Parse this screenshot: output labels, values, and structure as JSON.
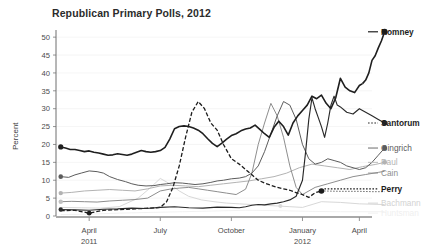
{
  "chart_data": {
    "type": "line",
    "title": "Republican Primary Polls, 2012",
    "xlabel": "",
    "ylabel": "Percent",
    "ylim": [
      0,
      52
    ],
    "xlim": [
      0,
      100
    ],
    "grid": "horizontal-faint",
    "legend_position": "right-inline-endlabels",
    "yticks": [
      0,
      5,
      10,
      15,
      20,
      25,
      30,
      35,
      40,
      45,
      50
    ],
    "ytick_labels": [
      "0",
      "5",
      "10",
      "15",
      "20",
      "25",
      "30",
      "35",
      "40",
      "45",
      "50"
    ],
    "xticks": [
      10.5,
      33.0,
      55.5,
      78.0,
      96.0
    ],
    "xtick_labels": [
      "April",
      "July",
      "October",
      "January",
      "April"
    ],
    "xtick_sublabels": [
      "2011",
      "",
      "",
      "2012",
      ""
    ],
    "x_unit": "percent-of-timeline (Feb 2011 - May 2012)",
    "series": [
      {
        "name": "Romney",
        "label": "Romney",
        "color": "#1f1f1f",
        "width": 1.6,
        "dash": "none",
        "emphasis": "strong",
        "end_value": 51.5,
        "start_value": 19.3,
        "x": [
          1.5,
          3,
          4.5,
          6,
          7.5,
          9,
          10.5,
          12,
          13.5,
          15,
          16.5,
          18,
          19.5,
          21,
          22.5,
          24,
          25.5,
          27,
          28.5,
          30,
          31.5,
          33,
          34.5,
          36,
          37.5,
          39,
          40.5,
          42,
          43.5,
          45,
          46.5,
          48,
          49.5,
          51,
          52.5,
          54,
          55.5,
          57,
          58.5,
          60,
          61.5,
          63,
          64.5,
          66,
          67.5,
          69,
          70.5,
          72,
          73.5,
          75,
          76.5,
          78,
          79.5,
          81,
          82.5,
          84,
          85.5,
          87,
          88.5,
          90,
          91.5,
          93,
          94.5,
          96,
          97
        ],
        "y": [
          19.3,
          19.0,
          18.6,
          18.6,
          18.3,
          18.0,
          18.2,
          17.8,
          17.6,
          17.3,
          17.0,
          17.1,
          17.4,
          17.2,
          17.0,
          17.3,
          17.8,
          18.3,
          18.0,
          17.8,
          18.0,
          18.3,
          19.2,
          21.5,
          24.4,
          25.0,
          25.2,
          25.0,
          24.6,
          24.0,
          23.0,
          21.6,
          20.3,
          19.4,
          20.4,
          21.5,
          22.5,
          23.0,
          23.8,
          24.3,
          24.6,
          25.4,
          24.2,
          23.0,
          22.0,
          24.8,
          26.5,
          25.0,
          22.6,
          26.0,
          28.0,
          29.5,
          31.0,
          33.5,
          32.8,
          33.8,
          31.5,
          30.0,
          33.0,
          38.5,
          36.0,
          35.0,
          34.5,
          36.5,
          37.0
        ]
      },
      {
        "name": "Romney-late",
        "label": "",
        "color": "#1f1f1f",
        "width": 1.6,
        "dash": "none",
        "emphasis": "strong",
        "x": [
          97,
          98,
          99,
          100,
          101,
          102,
          103,
          104
        ],
        "y": [
          37.0,
          38.0,
          40.0,
          43.5,
          44.8,
          47.0,
          49.0,
          51.5
        ]
      },
      {
        "name": "Santorum",
        "label": "Santorum",
        "color": "#2a2a2a",
        "width": 1.15,
        "dash": "none",
        "emphasis": "strong",
        "end_value": 26.0,
        "start_value": 1.8,
        "x": [
          1.5,
          6,
          10.5,
          15,
          19.5,
          24,
          28.5,
          33,
          37.5,
          42,
          46.5,
          51,
          55.5,
          58,
          60,
          62,
          64,
          66,
          68,
          70,
          72,
          74,
          76,
          78,
          79,
          80,
          81,
          82,
          83,
          84,
          85,
          86,
          87,
          88,
          89,
          90,
          92,
          94,
          96,
          98,
          100,
          102,
          104
        ],
        "y": [
          1.8,
          1.7,
          1.6,
          1.9,
          2.0,
          2.2,
          2.1,
          2.4,
          2.6,
          2.3,
          2.2,
          2.5,
          2.4,
          2.3,
          2.6,
          3.0,
          3.2,
          3.1,
          3.4,
          3.6,
          4.0,
          4.5,
          5.5,
          10.0,
          18.0,
          27.0,
          33.0,
          30.0,
          27.5,
          25.0,
          22.0,
          26.0,
          31.0,
          33.5,
          31.0,
          30.5,
          29.0,
          28.5,
          30.0,
          29.0,
          28.0,
          27.0,
          26.0
        ]
      },
      {
        "name": "Gingrich",
        "label": "Gingrich",
        "color": "#5c5c5c",
        "width": 1.0,
        "dash": "none",
        "emphasis": "medium",
        "end_value": 19.0,
        "start_value": 11.0,
        "x": [
          1.5,
          4,
          6,
          8,
          10.5,
          13,
          15,
          17,
          19.5,
          22,
          24,
          26,
          28.5,
          31,
          33,
          35,
          37.5,
          40,
          42,
          44,
          46.5,
          49,
          51,
          53,
          55.5,
          58,
          60,
          62,
          64,
          66,
          68,
          70,
          72,
          74,
          76,
          78,
          80,
          82,
          84,
          86,
          88,
          90,
          92,
          94,
          96,
          98,
          100,
          102,
          104
        ],
        "y": [
          11.0,
          10.8,
          11.5,
          12.0,
          12.6,
          12.4,
          12.0,
          11.0,
          10.2,
          9.6,
          9.0,
          8.6,
          8.4,
          8.5,
          8.8,
          9.0,
          9.3,
          9.2,
          9.0,
          8.8,
          9.0,
          9.4,
          9.8,
          10.0,
          10.4,
          10.6,
          11.0,
          12.0,
          14.0,
          18.0,
          23.0,
          28.0,
          32.0,
          31.0,
          27.0,
          20.0,
          16.0,
          14.5,
          15.0,
          16.0,
          15.5,
          15.0,
          14.0,
          13.5,
          13.0,
          13.5,
          15.0,
          17.0,
          19.0
        ]
      },
      {
        "name": "Paul",
        "label": "Paul",
        "color": "#b3b3b3",
        "width": 1.0,
        "dash": "none",
        "emphasis": "light",
        "end_value": 15.0,
        "start_value": 6.4,
        "x": [
          1.5,
          5,
          9,
          13,
          17,
          21,
          25,
          29,
          33,
          37,
          41,
          45,
          49,
          53,
          57,
          61,
          65,
          69,
          73,
          77,
          81,
          85,
          89,
          93,
          97,
          101,
          104
        ],
        "y": [
          6.4,
          6.6,
          7.0,
          7.2,
          7.4,
          7.2,
          7.0,
          7.6,
          8.4,
          8.6,
          8.4,
          8.2,
          8.6,
          9.0,
          9.4,
          9.8,
          10.4,
          11.0,
          12.0,
          13.5,
          14.5,
          14.0,
          13.5,
          13.0,
          13.8,
          14.4,
          15.0
        ]
      },
      {
        "name": "Cain",
        "label": "Cain",
        "color": "#8e8e8e",
        "width": 1.0,
        "dash": "none",
        "emphasis": "medium",
        "end_value": 12.5,
        "start_value": 4.0,
        "x": [
          1.5,
          5,
          9,
          13,
          17,
          21,
          25,
          29,
          33,
          36,
          39,
          42,
          45,
          48,
          51,
          54,
          57,
          60,
          62,
          64,
          66,
          68,
          70,
          72,
          74,
          76,
          78,
          82,
          86,
          90,
          94,
          98,
          102,
          104
        ],
        "y": [
          4.0,
          4.1,
          4.0,
          3.9,
          4.2,
          4.4,
          4.6,
          5.0,
          7.0,
          7.5,
          7.8,
          8.0,
          7.6,
          7.2,
          6.8,
          6.4,
          6.0,
          7.5,
          12.0,
          20.0,
          26.0,
          31.5,
          28.0,
          22.0,
          14.0,
          8.0,
          6.0,
          8.0,
          9.0,
          10.0,
          11.0,
          11.6,
          12.2,
          12.5
        ]
      },
      {
        "name": "Perry",
        "label": "Perry",
        "color": "#1c1c1c",
        "width": 1.3,
        "dash": "4,2",
        "emphasis": "strong",
        "end_value": 6.8,
        "start_value": 1.5,
        "x": [
          1.5,
          6,
          10.5,
          15,
          20,
          25,
          30,
          33,
          35,
          37,
          39,
          41,
          43,
          45,
          47,
          49,
          51,
          53,
          55.5,
          58,
          60,
          62,
          64,
          66,
          68,
          70,
          72,
          74,
          76,
          78,
          80,
          82,
          84
        ],
        "y": [
          1.5,
          1.6,
          0.8,
          1.6,
          1.8,
          2.0,
          2.2,
          2.4,
          4.0,
          8.0,
          14.0,
          22.0,
          29.0,
          32.0,
          30.0,
          26.0,
          24.0,
          20.0,
          16.0,
          14.5,
          13.0,
          11.5,
          10.0,
          9.2,
          8.6,
          8.0,
          7.6,
          7.2,
          6.5,
          6.0,
          5.2,
          6.5,
          7.0
        ]
      },
      {
        "name": "Perry-trail",
        "label": "",
        "color": "#1c1c1c",
        "width": 1.0,
        "dash": "1,2",
        "emphasis": "strong",
        "x": [
          84,
          90,
          96,
          100,
          104
        ],
        "y": [
          7.0,
          6.9,
          6.9,
          6.8,
          6.8
        ]
      },
      {
        "name": "Bachmann",
        "label": "Bachmann",
        "color": "#d2d2d2",
        "width": 0.9,
        "dash": "none",
        "emphasis": "faint",
        "end_value": 3.2,
        "start_value": 2.4,
        "x": [
          1.5,
          8,
          14,
          20,
          26,
          30,
          33,
          36,
          39,
          42,
          46,
          50,
          54,
          58,
          62,
          66,
          70,
          74,
          78,
          84,
          90,
          96,
          104
        ],
        "y": [
          2.4,
          2.3,
          2.2,
          2.6,
          5.0,
          8.0,
          10.5,
          9.0,
          7.0,
          5.5,
          4.5,
          4.0,
          3.6,
          3.4,
          3.2,
          3.0,
          2.8,
          2.6,
          2.4,
          4.0,
          3.8,
          3.4,
          3.2
        ]
      },
      {
        "name": "Huntsman",
        "label": "Huntsman",
        "color": "#efefef",
        "width": 0.9,
        "dash": "none",
        "emphasis": "ghost",
        "end_value": 1.2,
        "start_value": 0.4,
        "x": [
          1.5,
          10,
          20,
          30,
          40,
          50,
          60,
          70,
          80,
          90,
          104
        ],
        "y": [
          0.4,
          0.5,
          0.8,
          1.0,
          1.2,
          1.4,
          1.6,
          1.5,
          1.3,
          1.2,
          1.2
        ]
      }
    ],
    "start_markers": [
      {
        "series": "Romney",
        "x": 1.5,
        "y": 19.3,
        "color": "#1f1f1f",
        "r": 2.6
      },
      {
        "series": "Gingrich",
        "x": 1.5,
        "y": 11.0,
        "color": "#5c5c5c",
        "r": 2.3
      },
      {
        "series": "Paul",
        "x": 1.5,
        "y": 6.4,
        "color": "#b3b3b3",
        "r": 2.2
      },
      {
        "series": "Cain",
        "x": 1.5,
        "y": 4.0,
        "color": "#c0c0c0",
        "r": 2.2
      },
      {
        "series": "Santorum",
        "x": 1.5,
        "y": 1.8,
        "color": "#2a2a2a",
        "r": 2.2
      },
      {
        "series": "Perry",
        "x": 10.5,
        "y": 0.8,
        "color": "#1c1c1c",
        "r": 2.4
      }
    ],
    "end_markers": [
      {
        "series": "Romney",
        "x": 104,
        "y": 51.5,
        "color": "#1f1f1f",
        "r": 3.0
      },
      {
        "series": "Santorum",
        "x": 104,
        "y": 26.0,
        "color": "#2a2a2a",
        "r": 2.8
      },
      {
        "series": "Gingrich",
        "x": 104,
        "y": 19.0,
        "color": "#5c5c5c",
        "r": 2.5
      },
      {
        "series": "Paul",
        "x": 104,
        "y": 15.0,
        "color": "#b3b3b3",
        "r": 2.4
      },
      {
        "series": "Perry",
        "x": 84,
        "y": 7.0,
        "color": "#1c1c1c",
        "r": 2.8
      },
      {
        "series": "Bachmann",
        "x": 71,
        "y": 2.8,
        "color": "#dadada",
        "r": 2.0
      }
    ],
    "legend_entries": [
      {
        "label": "Romney",
        "color": "#1f1f1f",
        "emphasis": "strong",
        "y_value": 51.5
      },
      {
        "label": "Santorum",
        "color": "#2a2a2a",
        "emphasis": "strong",
        "y_value": 26.0
      },
      {
        "label": "Gingrich",
        "color": "#5c5c5c",
        "emphasis": "medium",
        "y_value": 19.0
      },
      {
        "label": "Paul",
        "color": "#b3b3b3",
        "emphasis": "light",
        "y_value": 15.0
      },
      {
        "label": "Cain",
        "color": "#8e8e8e",
        "emphasis": "medium",
        "y_value": 12.0
      },
      {
        "label": "Perry",
        "color": "#1c1c1c",
        "emphasis": "strong",
        "y_value": 7.6
      },
      {
        "label": "Bachmann",
        "color": "#d2d2d2",
        "emphasis": "faint",
        "y_value": 3.6
      },
      {
        "label": "Huntsman",
        "color": "#efefef",
        "emphasis": "ghost",
        "y_value": 0.8
      }
    ]
  }
}
